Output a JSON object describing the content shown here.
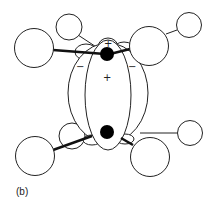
{
  "figure": {
    "panel_label": "(b)",
    "signs": {
      "top_plus": "+",
      "center_plus": "+",
      "left_minus": "−",
      "right_minus": "−"
    },
    "colors": {
      "stroke": "#222222",
      "fill": "#ffffff",
      "atom": "#000000"
    }
  }
}
